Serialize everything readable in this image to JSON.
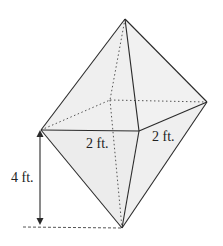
{
  "figure": {
    "type": "octahedron-diagram",
    "colors": {
      "face_fill": "#efefef",
      "edge": "#2a2a2a",
      "hidden_edge": "#555555",
      "background": "#ffffff"
    },
    "vertices": {
      "top": [
        125,
        19
      ],
      "left": [
        41,
        130
      ],
      "front": [
        139,
        131
      ],
      "right": [
        207,
        102
      ],
      "back": [
        110,
        100
      ],
      "bottom": [
        122,
        228
      ]
    },
    "labels": {
      "height": "4 ft.",
      "base_front": "2 ft.",
      "base_side": "2 ft."
    }
  }
}
